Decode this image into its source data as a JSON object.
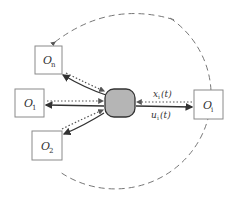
{
  "diagram": {
    "center_node": {
      "label": "",
      "fill": "#b5b5b5"
    },
    "nodes": [
      {
        "id": "On",
        "label": "O",
        "subscript": "n"
      },
      {
        "id": "O1",
        "label": "O",
        "subscript": "1"
      },
      {
        "id": "O2",
        "label": "O",
        "subscript": "2"
      },
      {
        "id": "Oi",
        "label": "O",
        "subscript": "i"
      }
    ],
    "edge_labels": {
      "top": "x",
      "top_sub": "i",
      "top_arg": "(t)",
      "bottom": "u",
      "bottom_sub": "i",
      "bottom_arg": "(t)"
    },
    "colors": {
      "box_stroke": "#8a8a8a",
      "solid_arrow": "#333333",
      "dotted_arrow": "#555555",
      "dashed_arc": "#777777"
    }
  }
}
